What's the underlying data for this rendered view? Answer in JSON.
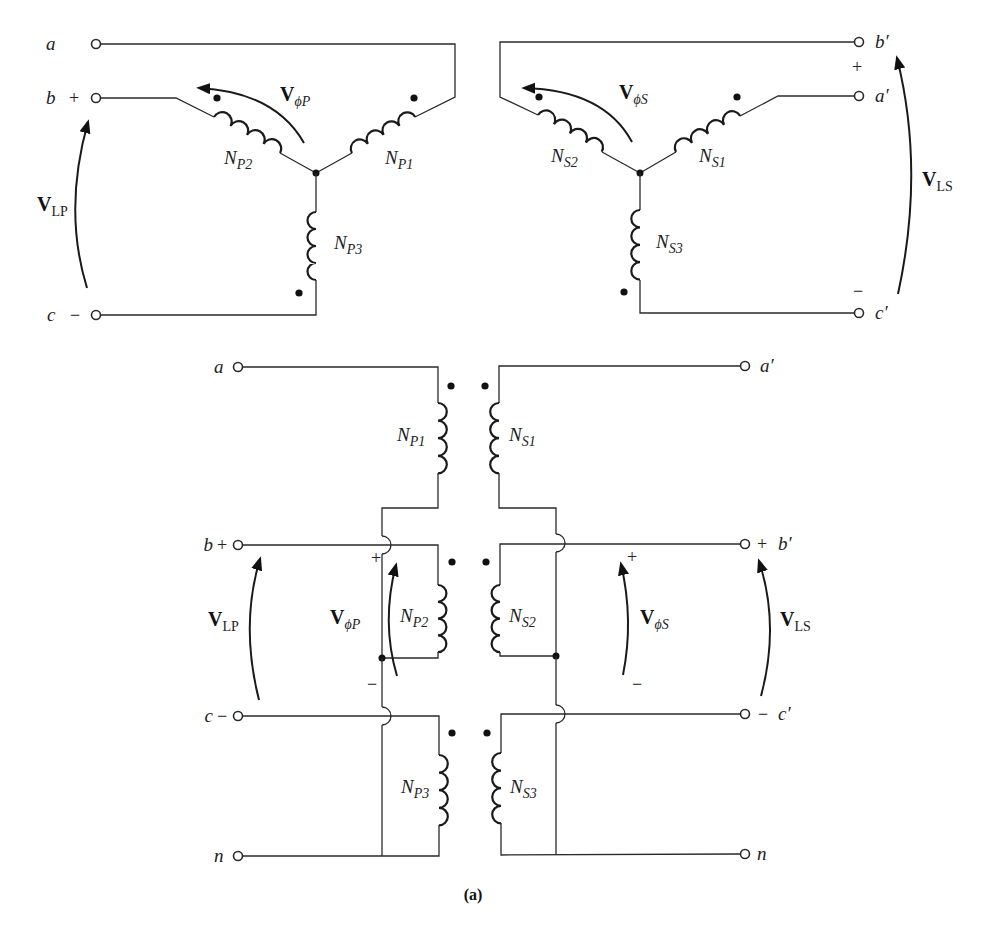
{
  "figure": {
    "caption": "(a)",
    "colors": {
      "line": "#2a2a2a",
      "background": "#ffffff"
    }
  },
  "top_left_wye": {
    "terminals": {
      "a": "a",
      "b": "b",
      "c": "c"
    },
    "signs": {
      "b": "+",
      "c": "−"
    },
    "windings": [
      {
        "main": "N",
        "sub": "P1"
      },
      {
        "main": "N",
        "sub": "P2"
      },
      {
        "main": "N",
        "sub": "P3"
      }
    ],
    "voltage_phase": {
      "main": "V",
      "sub_phi": "ϕ",
      "sub": "P"
    },
    "voltage_line": {
      "main": "V",
      "sub": "LP"
    }
  },
  "top_right_wye": {
    "terminals": {
      "a": "a′",
      "b": "b′",
      "c": "c′"
    },
    "signs": {
      "plus": "+",
      "minus": "−"
    },
    "windings": [
      {
        "main": "N",
        "sub": "S1"
      },
      {
        "main": "N",
        "sub": "S2"
      },
      {
        "main": "N",
        "sub": "S3"
      }
    ],
    "voltage_phase": {
      "main": "V",
      "sub_phi": "ϕ",
      "sub": "S"
    },
    "voltage_line": {
      "main": "V",
      "sub": "LS"
    }
  },
  "bottom_schematic": {
    "primary_terminals": {
      "a": "a",
      "b": "b",
      "c": "c",
      "n": "n"
    },
    "secondary_terminals": {
      "a": "a′",
      "b": "b′",
      "c": "c′",
      "n": "n"
    },
    "signs": {
      "plus": "+",
      "minus": "−"
    },
    "primary_windings": [
      {
        "main": "N",
        "sub": "P1"
      },
      {
        "main": "N",
        "sub": "P2"
      },
      {
        "main": "N",
        "sub": "P3"
      }
    ],
    "secondary_windings": [
      {
        "main": "N",
        "sub": "S1"
      },
      {
        "main": "N",
        "sub": "S2"
      },
      {
        "main": "N",
        "sub": "S3"
      }
    ],
    "voltage_phase_primary": {
      "main": "V",
      "sub_phi": "ϕ",
      "sub": "P"
    },
    "voltage_phase_secondary": {
      "main": "V",
      "sub_phi": "ϕ",
      "sub": "S"
    },
    "voltage_line_primary": {
      "main": "V",
      "sub": "LP"
    },
    "voltage_line_secondary": {
      "main": "V",
      "sub": "LS"
    }
  }
}
